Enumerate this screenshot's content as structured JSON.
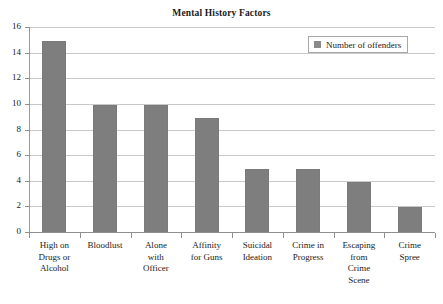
{
  "clipped_top_text": "",
  "chart_data": {
    "type": "bar",
    "title": "Mental History Factors",
    "xlabel": "",
    "ylabel": "",
    "ylim": [
      0,
      16
    ],
    "ytick_values": [
      0,
      2,
      4,
      6,
      8,
      10,
      12,
      14,
      16
    ],
    "ytick_labels": [
      "0",
      "2",
      "4",
      "6",
      "8",
      "10",
      "12",
      "14",
      "16"
    ],
    "grid": true,
    "grid_axis": "y",
    "legend_position": "top-right",
    "bar_color": "#7e7e7e",
    "grid_color": "#c9c9c9",
    "axis_color": "#8f8f8f",
    "categories": [
      "High on Drugs or Alcohol",
      "Bloodlust",
      "Alone with Officer",
      "Affinity for Guns",
      "Suicidal Ideation",
      "Crime in Progress",
      "Escaping from Crime Scene",
      "Crime Spree"
    ],
    "category_lines": [
      [
        "High on",
        "Drugs or",
        "Alcohol"
      ],
      [
        "Bloodlust"
      ],
      [
        "Alone",
        "with",
        "Officer"
      ],
      [
        "Affinity",
        "for Guns"
      ],
      [
        "Suicidal",
        "Ideation"
      ],
      [
        "Crime in",
        "Progress"
      ],
      [
        "Escaping",
        "from",
        "Crime",
        "Scene"
      ],
      [
        "Crime",
        "Spree"
      ]
    ],
    "series": [
      {
        "name": "Number of offenders",
        "values": [
          15,
          10,
          10,
          9,
          5,
          5,
          4,
          2
        ]
      }
    ]
  },
  "legend": {
    "entries": [
      {
        "label": "Number of offenders",
        "color": "#8a8a8a"
      }
    ]
  }
}
